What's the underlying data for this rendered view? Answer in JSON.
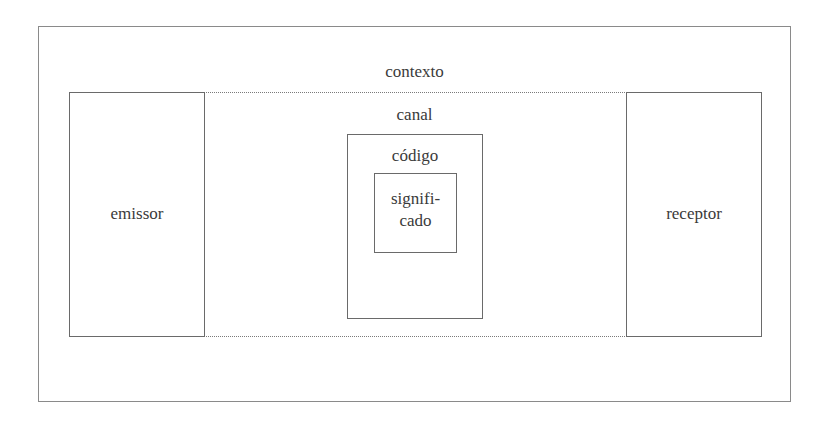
{
  "diagram": {
    "type": "nested communication model",
    "context": {
      "label": "contexto"
    },
    "sender": {
      "label": "emissor"
    },
    "receiver": {
      "label": "receptor"
    },
    "channel": {
      "label": "canal"
    },
    "code": {
      "label": "código"
    },
    "meaning": {
      "label_line1": "signifi-",
      "label_line2": "cado"
    }
  }
}
